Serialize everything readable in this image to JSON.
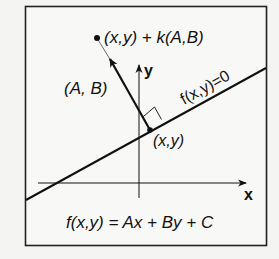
{
  "diagram": {
    "labels": {
      "point_plus_normal": "(x,y) + k(A,B)",
      "normal_vector": "(A, B)",
      "y_axis": "y",
      "x_axis": "x",
      "line_equation": "f(x,y)=0",
      "point": "(x,y)",
      "function_definition": "f(x,y) = Ax + By + C"
    },
    "colors": {
      "background": "#f4f4f2",
      "stroke": "#111111"
    }
  }
}
